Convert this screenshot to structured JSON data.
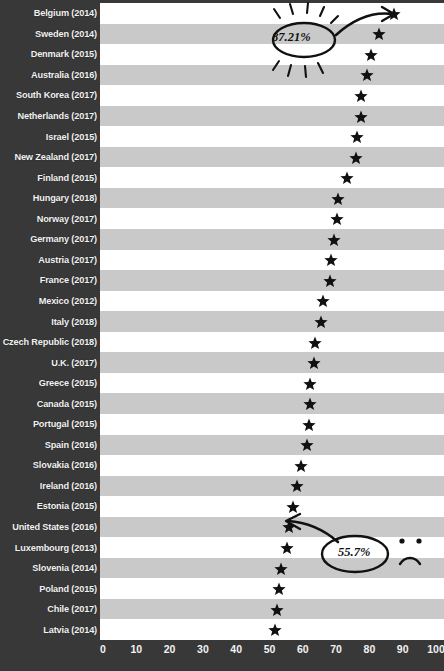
{
  "chart_data": {
    "type": "scatter",
    "title": "",
    "xlabel": "",
    "ylabel": "",
    "xlim": [
      0,
      100
    ],
    "xticks": [
      0,
      10,
      20,
      30,
      40,
      50,
      60,
      70,
      80,
      90,
      100
    ],
    "grid": false,
    "legend": null,
    "marker": "star",
    "categories": [
      "Belgium (2014)",
      "Sweden (2014)",
      "Denmark (2015)",
      "Australia (2016)",
      "South Korea (2017)",
      "Netherlands (2017)",
      "Israel (2015)",
      "New Zealand (2017)",
      "Finland (2015)",
      "Hungary (2018)",
      "Norway (2017)",
      "Germany (2017)",
      "Austria (2017)",
      "France (2017)",
      "Mexico (2012)",
      "Italy (2018)",
      "Czech Republic (2018)",
      "U.K. (2017)",
      "Greece (2015)",
      "Canada (2015)",
      "Portugal (2015)",
      "Spain (2016)",
      "Slovakia (2016)",
      "Ireland (2016)",
      "Estonia (2015)",
      "United States (2016)",
      "Luxembourg (2013)",
      "Slovenia (2014)",
      "Poland (2015)",
      "Chile (2017)",
      "Latvia (2014)"
    ],
    "values": [
      87.21,
      82.6,
      80.3,
      79.0,
      77.2,
      77.3,
      76.1,
      75.7,
      73.1,
      70.3,
      70.1,
      69.1,
      68.3,
      67.9,
      66.0,
      65.4,
      63.5,
      63.2,
      62.1,
      62.0,
      61.8,
      61.0,
      59.4,
      58.0,
      57.0,
      55.7,
      55.1,
      53.2,
      52.8,
      52.0,
      51.6
    ],
    "annotations": [
      {
        "id": "high",
        "label": "87.21%",
        "points_to": "Belgium (2014)",
        "style": "hand-drawn-oval-with-sunburst-and-arrow"
      },
      {
        "id": "low",
        "label": "55.7%",
        "points_to": "United States (2016)",
        "style": "hand-drawn-oval-with-arrow-and-sad-face"
      }
    ]
  },
  "axis": {
    "tick_labels": [
      "0",
      "10",
      "20",
      "30",
      "40",
      "50",
      "60",
      "70",
      "80",
      "90",
      "100"
    ]
  },
  "colors": {
    "panel_background": "#383838",
    "label_text": "#f2f2f2",
    "stripe_light": "#ffffff",
    "stripe_dark": "#c9c9c9",
    "marker": "#111111",
    "annotation_ink": "#111111"
  }
}
